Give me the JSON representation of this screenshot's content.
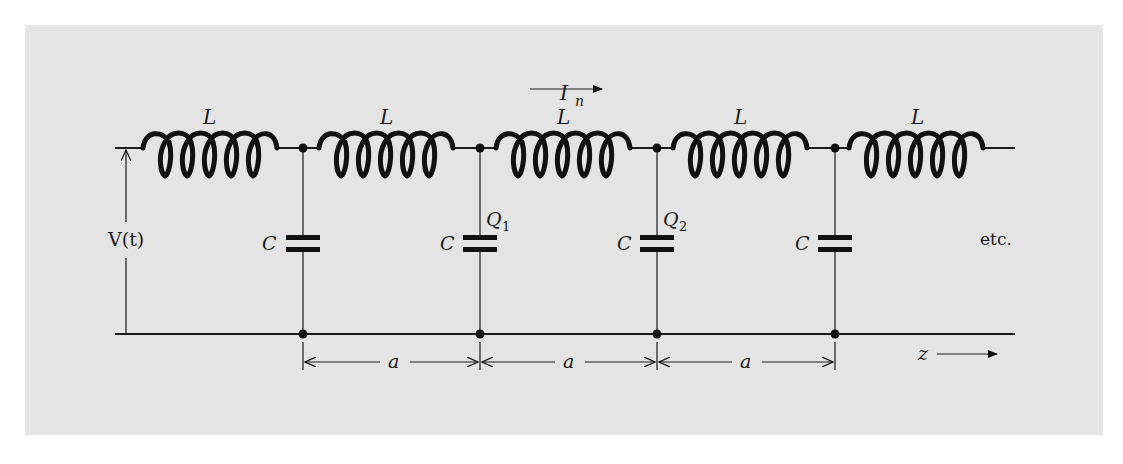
{
  "figure": {
    "background_color": "#e4e4e4",
    "ink_color": "#111111"
  },
  "labels": {
    "current": "I",
    "current_sub": "n",
    "voltage": "V(t)",
    "etc": "etc.",
    "z_axis": "z",
    "spacing": "a",
    "inductor": "L",
    "capacitor": "C",
    "charge": "Q",
    "charge_1_sub": "1",
    "charge_2_sub": "2"
  },
  "inductors": [
    {
      "label": "L"
    },
    {
      "label": "L"
    },
    {
      "label": "L"
    },
    {
      "label": "L"
    },
    {
      "label": "L"
    }
  ],
  "capacitors": [
    {
      "label": "C",
      "charge": ""
    },
    {
      "label": "C",
      "charge": "Q1"
    },
    {
      "label": "C",
      "charge": "Q2"
    },
    {
      "label": "C",
      "charge": ""
    }
  ],
  "dimensions": [
    {
      "label": "a"
    },
    {
      "label": "a"
    },
    {
      "label": "a"
    }
  ]
}
